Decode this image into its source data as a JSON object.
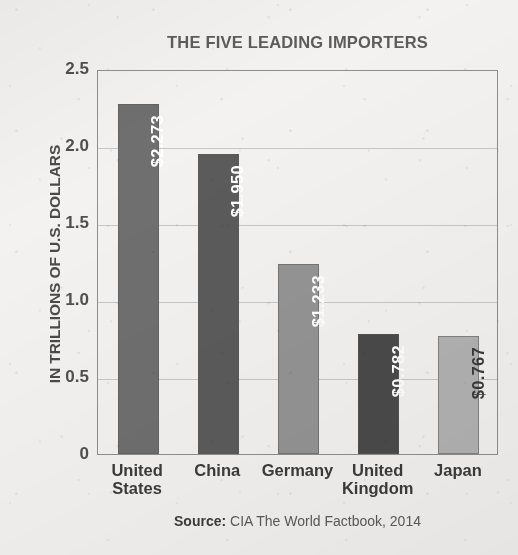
{
  "chart_data": {
    "type": "bar",
    "title": "THE FIVE LEADING IMPORTERS",
    "xlabel": "",
    "ylabel": "IN TRILLIONS OF U.S. DOLLARS",
    "ylim": [
      0,
      2.5
    ],
    "grid": true,
    "legend": "none",
    "orientation": "vertical",
    "categories": [
      "United States",
      "China",
      "Germany",
      "United Kingdom",
      "Japan"
    ],
    "values": [
      2.273,
      1.95,
      1.233,
      0.782,
      0.767
    ],
    "value_labels": [
      "$2.273",
      "$1.950",
      "$1.233",
      "$0.782",
      "$0.767"
    ],
    "bar_colors": [
      "#6f6f6f",
      "#5b5b5b",
      "#949494",
      "#4a4a4a",
      "#b2b2b2"
    ],
    "value_label_colors": [
      "#ffffff",
      "#ffffff",
      "#ffffff",
      "#ffffff",
      "#3a3a3a"
    ],
    "y_ticks": [
      "2.5",
      "2.0",
      "1.5",
      "1.0",
      "0.5",
      "0"
    ],
    "y_tick_values": [
      2.5,
      2.0,
      1.5,
      1.0,
      0.5,
      0
    ],
    "annotations": {
      "source_prefix": "Source:",
      "source_text": " CIA The World Factbook, 2014"
    }
  },
  "palette": {
    "paper": "#f3f2f0",
    "axis": "#8e8e8e",
    "gridline": "#c7c7c7",
    "title_color": "#5c5c5c",
    "label_color": "#3b3b3b"
  }
}
